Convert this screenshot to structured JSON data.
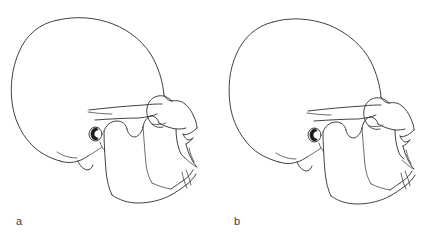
{
  "figure": {
    "background_color": "#ffffff",
    "line_color": "#2b2b2b",
    "label_color": "#3a3a3a",
    "width": 437,
    "height": 242
  },
  "panels": [
    {
      "label": "a",
      "caption_position": "bottom-left",
      "view": "lateral",
      "subject": "human skull",
      "features": [
        "cranial vault",
        "frontal bone",
        "orbital rim",
        "nasal bone",
        "nasal aperture",
        "zygomatic arch",
        "external auditory meatus",
        "mastoid process",
        "mandibular ramus",
        "coronoid process",
        "mandibular condyle",
        "gonial angle",
        "maxillary alveolar process",
        "mandibular alveolar process",
        "mental protuberance"
      ]
    },
    {
      "label": "b",
      "caption_position": "bottom-left",
      "view": "lateral",
      "subject": "human skull",
      "features": [
        "cranial vault",
        "frontal bone",
        "orbital rim",
        "nasal bone",
        "nasal aperture",
        "zygomatic arch",
        "external auditory meatus",
        "mastoid process",
        "mandibular ramus",
        "coronoid process",
        "mandibular condyle",
        "gonial angle",
        "maxillary alveolar process",
        "mandibular alveolar process",
        "mental protuberance"
      ]
    }
  ]
}
